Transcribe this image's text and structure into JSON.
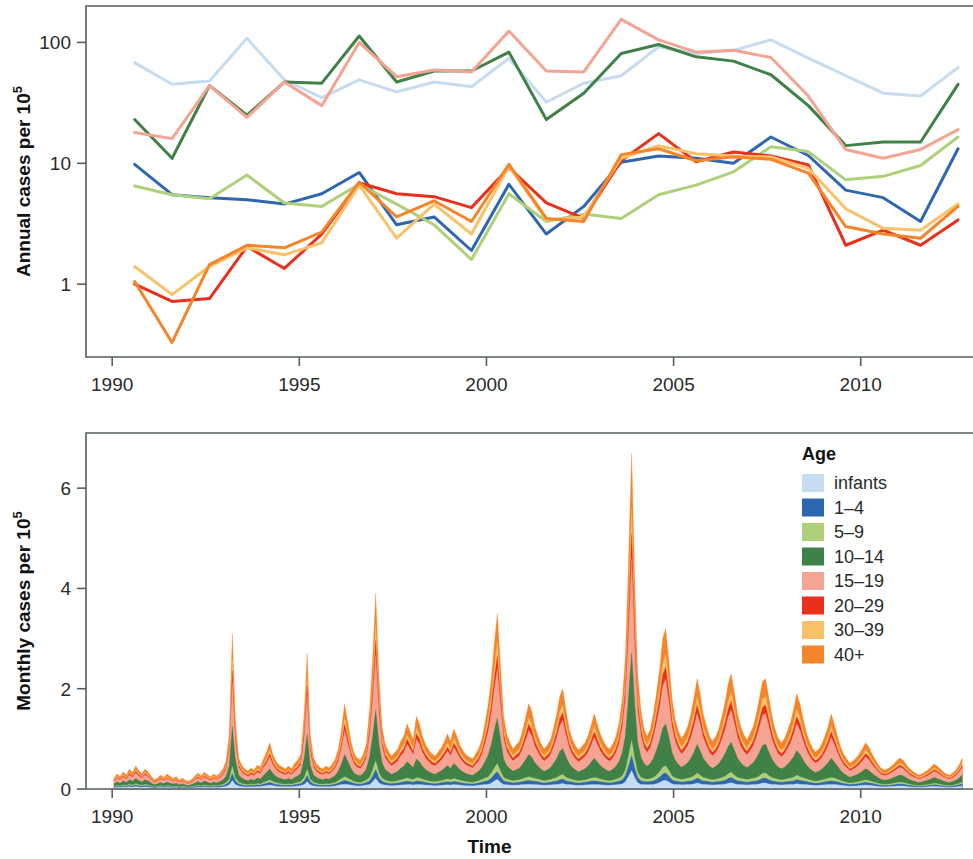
{
  "figure": {
    "xlabel": "Time",
    "panels": [
      {
        "id": "annual",
        "ylabel_main": "Annual cases per 10",
        "ylabel_sup": "5"
      },
      {
        "id": "monthly",
        "ylabel_main": "Monthly cases per 10",
        "ylabel_sup": "5"
      }
    ]
  },
  "legend": {
    "title": "Age",
    "items": [
      {
        "label": "infants",
        "color": "#c6dcf0"
      },
      {
        "label": "1–4",
        "color": "#2f66b0"
      },
      {
        "label": "5–9",
        "color": "#aed07a"
      },
      {
        "label": "10–14",
        "color": "#3f8146"
      },
      {
        "label": "15–19",
        "color": "#f5a393"
      },
      {
        "label": "20–29",
        "color": "#e8301c"
      },
      {
        "label": "30–39",
        "color": "#fbc169"
      },
      {
        "label": "40+",
        "color": "#f5852a"
      }
    ]
  },
  "chart_data": [
    {
      "id": "annual",
      "type": "line",
      "title": "",
      "xlabel": "",
      "ylabel": "Annual cases per 10^5",
      "yscale": "log",
      "ylim": [
        0.25,
        200
      ],
      "yticks": [
        1,
        10,
        100
      ],
      "ytick_labels": [
        "1",
        "10",
        "100"
      ],
      "xlim": [
        1989.3,
        2013.0
      ],
      "xticks": [
        1990,
        1995,
        2000,
        2005,
        2010
      ],
      "xtick_labels": [
        "1990",
        "1995",
        "2000",
        "2005",
        "2010"
      ],
      "grid": false,
      "legend_position": "none",
      "x": [
        1990.6,
        1991.6,
        1992.6,
        1993.6,
        1994.6,
        1995.6,
        1996.6,
        1997.6,
        1998.6,
        1999.6,
        2000.6,
        2001.6,
        2002.6,
        2003.6,
        2004.6,
        2005.6,
        2006.6,
        2007.6,
        2008.6,
        2009.6,
        2010.6,
        2011.6,
        2012.6
      ],
      "series": [
        {
          "name": "infants",
          "color": "#c6dcf0",
          "values": [
            68,
            45,
            48,
            108,
            49,
            35,
            49,
            39,
            47,
            43,
            74,
            32,
            46,
            53,
            92,
            81,
            86,
            105,
            74,
            53,
            38,
            36,
            62
          ]
        },
        {
          "name": "1–4",
          "color": "#2f66b0",
          "values": [
            9.8,
            5.5,
            5.2,
            5.0,
            4.6,
            5.6,
            8.4,
            3.1,
            3.6,
            1.9,
            6.7,
            2.6,
            4.4,
            10.2,
            11.5,
            11.0,
            10.0,
            16.5,
            11.6,
            6.0,
            5.2,
            3.3,
            13.2
          ]
        },
        {
          "name": "5–9",
          "color": "#aed07a",
          "values": [
            6.5,
            5.5,
            5.1,
            8.0,
            4.7,
            4.4,
            6.7,
            4.6,
            3.1,
            1.6,
            5.6,
            3.3,
            3.8,
            3.5,
            5.5,
            6.6,
            8.5,
            13.7,
            12.5,
            7.3,
            7.8,
            9.6,
            16.5
          ]
        },
        {
          "name": "10–14",
          "color": "#3f8146",
          "values": [
            23,
            11,
            44,
            25,
            47,
            46,
            113,
            47,
            58,
            58,
            83,
            23,
            38,
            81,
            96,
            76,
            70,
            54,
            30,
            14,
            15,
            15,
            45
          ]
        },
        {
          "name": "15–19",
          "color": "#f5a393",
          "values": [
            18,
            16,
            44,
            24,
            47,
            30,
            100,
            52,
            59,
            57,
            124,
            58,
            57,
            155,
            105,
            83,
            86,
            75,
            36,
            13,
            11,
            13,
            19
          ]
        },
        {
          "name": "20–29",
          "color": "#e8301c",
          "values": [
            1.0,
            0.72,
            0.76,
            2.05,
            1.35,
            2.6,
            6.9,
            5.6,
            5.3,
            4.3,
            9.2,
            4.7,
            3.5,
            10.5,
            17.6,
            10.3,
            12.4,
            11.5,
            9.7,
            2.1,
            2.8,
            2.1,
            3.4
          ]
        },
        {
          "name": "30–39",
          "color": "#fbc169",
          "values": [
            1.4,
            0.82,
            1.4,
            2.0,
            1.75,
            2.2,
            6.6,
            2.4,
            4.6,
            2.6,
            9.5,
            3.4,
            3.6,
            11.0,
            14.0,
            12.0,
            11.5,
            11.3,
            9.1,
            4.2,
            2.9,
            2.8,
            4.6
          ]
        },
        {
          "name": "40+",
          "color": "#f5852a",
          "values": [
            1.05,
            0.33,
            1.45,
            2.1,
            2.0,
            2.7,
            7.0,
            3.6,
            4.9,
            3.3,
            9.8,
            3.5,
            3.3,
            11.8,
            13.2,
            10.5,
            11.3,
            10.8,
            8.3,
            3.0,
            2.6,
            2.4,
            4.4
          ]
        }
      ]
    },
    {
      "id": "monthly",
      "type": "area",
      "stacked": true,
      "title": "",
      "xlabel": "Time",
      "ylabel": "Monthly cases per 10^5",
      "yscale": "linear",
      "ylim": [
        0,
        7.1
      ],
      "yticks": [
        0,
        2,
        4,
        6
      ],
      "ytick_labels": [
        "0",
        "2",
        "4",
        "6"
      ],
      "xlim": [
        1989.3,
        2013.0
      ],
      "xticks": [
        1990,
        1995,
        2000,
        2005,
        2010
      ],
      "xtick_labels": [
        "1990",
        "1995",
        "2000",
        "2005",
        "2010"
      ],
      "grid": false,
      "legend_position": "right",
      "peak_annotation": {
        "year": 2003.9,
        "total": 6.7
      },
      "notable_peaks": [
        {
          "year": 1993.0,
          "total": 3.1
        },
        {
          "year": 1994.9,
          "total": 2.7
        },
        {
          "year": 1996.9,
          "total": 3.9
        },
        {
          "year": 2000.9,
          "total": 3.5
        },
        {
          "year": 2002.0,
          "total": 2.0
        },
        {
          "year": 2003.9,
          "total": 6.7
        },
        {
          "year": 2004.8,
          "total": 3.2
        },
        {
          "year": 2006.0,
          "total": 2.3
        },
        {
          "year": 2007.0,
          "total": 2.2
        },
        {
          "year": 2012.6,
          "total": 1.4
        }
      ],
      "x": [
        1990.05,
        1990.13,
        1990.21,
        1990.29,
        1990.38,
        1990.46,
        1990.54,
        1990.63,
        1990.71,
        1990.79,
        1990.88,
        1990.96,
        1991.04,
        1991.13,
        1991.21,
        1991.29,
        1991.38,
        1991.46,
        1991.54,
        1991.63,
        1991.71,
        1991.79,
        1991.88,
        1991.96,
        1992.04,
        1992.13,
        1992.21,
        1992.29,
        1992.38,
        1992.46,
        1992.54,
        1992.63,
        1992.71,
        1992.79,
        1992.88,
        1992.96,
        1993.04,
        1993.13,
        1993.21,
        1993.29,
        1993.38,
        1993.46,
        1993.54,
        1993.63,
        1993.71,
        1993.79,
        1993.88,
        1993.96,
        1994.04,
        1994.13,
        1994.21,
        1994.29,
        1994.38,
        1994.46,
        1994.54,
        1994.63,
        1994.71,
        1994.79,
        1994.88,
        1994.96,
        1995.04,
        1995.13,
        1995.21,
        1995.29,
        1995.38,
        1995.46,
        1995.54,
        1995.63,
        1995.71,
        1995.79,
        1995.88,
        1995.96,
        1996.04,
        1996.13,
        1996.21,
        1996.29,
        1996.38,
        1996.46,
        1996.54,
        1996.63,
        1996.71,
        1996.79,
        1996.88,
        1996.96,
        1997.04,
        1997.13,
        1997.21,
        1997.29,
        1997.38,
        1997.46,
        1997.54,
        1997.63,
        1997.71,
        1997.79,
        1997.88,
        1997.96,
        1998.04,
        1998.13,
        1998.21,
        1998.29,
        1998.38,
        1998.46,
        1998.54,
        1998.63,
        1998.71,
        1998.79,
        1998.88,
        1998.96,
        1999.04,
        1999.13,
        1999.21,
        1999.29,
        1999.38,
        1999.46,
        1999.54,
        1999.63,
        1999.71,
        1999.79,
        1999.88,
        1999.96,
        2000.04,
        2000.13,
        2000.21,
        2000.29,
        2000.38,
        2000.46,
        2000.54,
        2000.63,
        2000.71,
        2000.79,
        2000.88,
        2000.96,
        2001.04,
        2001.13,
        2001.21,
        2001.29,
        2001.38,
        2001.46,
        2001.54,
        2001.63,
        2001.71,
        2001.79,
        2001.88,
        2001.96,
        2002.04,
        2002.13,
        2002.21,
        2002.29,
        2002.38,
        2002.46,
        2002.54,
        2002.63,
        2002.71,
        2002.79,
        2002.88,
        2002.96,
        2003.04,
        2003.13,
        2003.21,
        2003.29,
        2003.38,
        2003.46,
        2003.54,
        2003.63,
        2003.71,
        2003.79,
        2003.88,
        2003.96,
        2004.04,
        2004.13,
        2004.21,
        2004.29,
        2004.38,
        2004.46,
        2004.54,
        2004.63,
        2004.71,
        2004.79,
        2004.88,
        2004.96,
        2005.04,
        2005.13,
        2005.21,
        2005.29,
        2005.38,
        2005.46,
        2005.54,
        2005.63,
        2005.71,
        2005.79,
        2005.88,
        2005.96,
        2006.04,
        2006.13,
        2006.21,
        2006.29,
        2006.38,
        2006.46,
        2006.54,
        2006.63,
        2006.71,
        2006.79,
        2006.88,
        2006.96,
        2007.04,
        2007.13,
        2007.21,
        2007.29,
        2007.38,
        2007.46,
        2007.54,
        2007.63,
        2007.71,
        2007.79,
        2007.88,
        2007.96,
        2008.04,
        2008.13,
        2008.21,
        2008.29,
        2008.38,
        2008.46,
        2008.54,
        2008.63,
        2008.71,
        2008.79,
        2008.88,
        2008.96,
        2009.04,
        2009.13,
        2009.21,
        2009.29,
        2009.38,
        2009.46,
        2009.54,
        2009.63,
        2009.71,
        2009.79,
        2009.88,
        2009.96,
        2010.04,
        2010.13,
        2010.21,
        2010.29,
        2010.38,
        2010.46,
        2010.54,
        2010.63,
        2010.71,
        2010.79,
        2010.88,
        2010.96,
        2011.04,
        2011.13,
        2011.21,
        2011.29,
        2011.38,
        2011.46,
        2011.54,
        2011.63,
        2011.71,
        2011.79,
        2011.88,
        2011.96,
        2012.04,
        2012.13,
        2012.21,
        2012.29,
        2012.38,
        2012.46,
        2012.54,
        2012.63,
        2012.71
      ],
      "totals": [
        0.22,
        0.3,
        0.25,
        0.34,
        0.28,
        0.4,
        0.33,
        0.46,
        0.37,
        0.3,
        0.4,
        0.34,
        0.26,
        0.18,
        0.22,
        0.28,
        0.23,
        0.3,
        0.26,
        0.21,
        0.25,
        0.18,
        0.22,
        0.17,
        0.15,
        0.2,
        0.26,
        0.32,
        0.26,
        0.34,
        0.29,
        0.24,
        0.3,
        0.26,
        0.32,
        0.4,
        0.55,
        1.1,
        3.1,
        1.4,
        0.62,
        0.48,
        0.4,
        0.36,
        0.42,
        0.38,
        0.48,
        0.44,
        0.6,
        0.75,
        0.92,
        0.7,
        0.55,
        0.48,
        0.44,
        0.4,
        0.46,
        0.4,
        0.52,
        0.58,
        0.7,
        1.5,
        2.7,
        1.1,
        0.62,
        0.5,
        0.44,
        0.4,
        0.46,
        0.42,
        0.5,
        0.6,
        0.8,
        1.2,
        1.7,
        1.35,
        0.95,
        0.72,
        0.62,
        0.58,
        0.7,
        0.9,
        1.6,
        2.6,
        3.9,
        2.2,
        1.25,
        0.9,
        0.76,
        0.66,
        0.72,
        0.8,
        0.95,
        1.05,
        1.3,
        1.15,
        0.98,
        1.45,
        1.3,
        1.05,
        0.88,
        0.78,
        0.7,
        0.66,
        0.74,
        0.82,
        0.95,
        1.1,
        0.95,
        1.2,
        1.05,
        0.88,
        0.76,
        0.68,
        0.64,
        0.6,
        0.7,
        0.8,
        1.0,
        1.3,
        1.65,
        2.2,
        2.9,
        3.5,
        2.4,
        1.45,
        1.1,
        0.92,
        0.8,
        0.88,
        0.95,
        1.15,
        1.4,
        1.7,
        1.55,
        1.25,
        1.05,
        0.9,
        0.8,
        0.88,
        0.98,
        1.2,
        1.5,
        1.85,
        2.0,
        1.55,
        1.2,
        1.0,
        0.86,
        0.78,
        0.84,
        0.92,
        1.05,
        1.25,
        1.5,
        1.3,
        1.1,
        0.95,
        0.85,
        0.8,
        0.9,
        1.05,
        1.3,
        1.8,
        2.6,
        4.4,
        6.7,
        4.2,
        2.3,
        1.55,
        1.2,
        1.05,
        1.2,
        1.5,
        1.9,
        2.4,
        3.0,
        3.2,
        2.5,
        1.8,
        1.4,
        1.15,
        1.0,
        1.1,
        1.25,
        1.5,
        1.8,
        2.2,
        1.9,
        1.5,
        1.25,
        1.05,
        0.95,
        1.05,
        1.2,
        1.45,
        1.75,
        2.1,
        2.3,
        1.9,
        1.5,
        1.25,
        1.08,
        0.98,
        1.1,
        1.25,
        1.5,
        1.8,
        2.15,
        2.2,
        1.85,
        1.45,
        1.2,
        1.02,
        0.92,
        1.0,
        1.15,
        1.35,
        1.6,
        1.9,
        1.7,
        1.4,
        1.15,
        0.95,
        0.82,
        0.74,
        0.8,
        0.9,
        1.05,
        1.25,
        1.5,
        1.3,
        1.05,
        0.85,
        0.7,
        0.6,
        0.52,
        0.56,
        0.62,
        0.7,
        0.8,
        0.92,
        0.85,
        0.72,
        0.6,
        0.5,
        0.42,
        0.38,
        0.4,
        0.44,
        0.5,
        0.56,
        0.62,
        0.58,
        0.5,
        0.42,
        0.36,
        0.32,
        0.28,
        0.3,
        0.34,
        0.38,
        0.44,
        0.5,
        0.46,
        0.4,
        0.34,
        0.3,
        0.28,
        0.32,
        0.38,
        0.48,
        0.62,
        0.85,
        1.1,
        1.4,
        1.15,
        0.85,
        0.6
      ]
    }
  ]
}
